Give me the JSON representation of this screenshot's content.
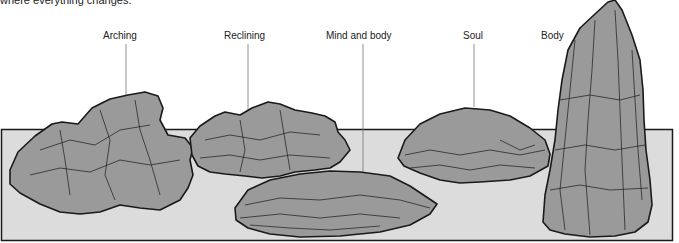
{
  "caption": "where everything changes.",
  "labels": [
    {
      "id": "arching",
      "text": "Arching"
    },
    {
      "id": "reclining",
      "text": "Reclining"
    },
    {
      "id": "mind-and-body",
      "text": "Mind and body"
    },
    {
      "id": "soul",
      "text": "Soul"
    },
    {
      "id": "body",
      "text": "Body"
    }
  ],
  "colors": {
    "base_fill": "#dcdcdc",
    "rock_fill": "#9a9a9a",
    "outline": "#1a1a1a",
    "leader_line": "#777777"
  }
}
